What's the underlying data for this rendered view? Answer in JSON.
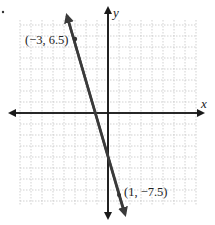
{
  "chart_data": {
    "type": "line",
    "title": "",
    "xlabel": "x",
    "ylabel": "y",
    "xlim": [
      -8,
      8
    ],
    "ylim": [
      -8.5,
      8.5
    ],
    "grid": true,
    "series": [
      {
        "name": "line through (-3, 6.5) and (1, -7.5)",
        "x": [
          -3,
          1
        ],
        "y": [
          6.5,
          -7.5
        ],
        "slope": -3.5,
        "intercept": -4
      }
    ],
    "annotations": [
      {
        "text": "(−3, 6.5)",
        "x": -3,
        "y": 6.5
      },
      {
        "text": "(1, −7.5)",
        "x": 1,
        "y": -7.5
      }
    ]
  },
  "labels": {
    "x_axis": "x",
    "y_axis": "y",
    "point_a": "(−3, 6.5)",
    "point_b": "(1, −7.5)"
  },
  "colors": {
    "axis": "#1a1a1a",
    "line": "#3a3a3a",
    "grid": "#b8b8b8"
  }
}
